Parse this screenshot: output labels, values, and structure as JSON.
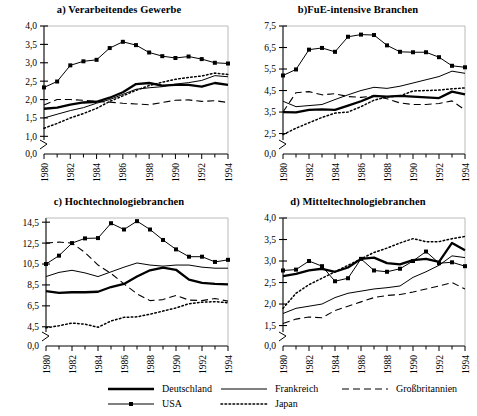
{
  "figure": {
    "width": 477,
    "height": 416,
    "background": "#ffffff",
    "line_color": "#000000",
    "axis_color": "#000000"
  },
  "legend": {
    "entries": [
      {
        "label": "Deutschland",
        "style": "thick-solid",
        "key": "deutschland"
      },
      {
        "label": "Frankreich",
        "style": "thin-solid",
        "key": "frankreich"
      },
      {
        "label": "Großbritannien",
        "style": "dashed",
        "key": "grossbritannien"
      },
      {
        "label": "USA",
        "style": "marker-line",
        "key": "usa"
      },
      {
        "label": "Japan",
        "style": "dotted",
        "key": "japan"
      }
    ]
  },
  "chart_data": [
    {
      "type": "line",
      "panel": "a",
      "title": "a) Verarbeitendes Gewerbe",
      "xlabel": "",
      "ylabel": "",
      "x": [
        1980,
        1981,
        1982,
        1983,
        1984,
        1985,
        1986,
        1987,
        1988,
        1989,
        1990,
        1991,
        1992,
        1993,
        1994
      ],
      "xtick_labels": [
        "1980",
        "1982",
        "1984",
        "1986",
        "1988",
        "1990",
        "1992",
        "1994"
      ],
      "ytick_labels": [
        "0,0",
        "1,0",
        "1,5",
        "2,0",
        "2,5",
        "3,0",
        "3,5",
        "4,0"
      ],
      "ytick_values": [
        0.0,
        1.0,
        1.5,
        2.0,
        2.5,
        3.0,
        3.5,
        4.0
      ],
      "ylim": [
        0.9,
        4.0
      ],
      "axis_break": true,
      "grid": false,
      "series": [
        {
          "name": "Deutschland",
          "style": "thick-solid",
          "values": [
            1.75,
            1.78,
            1.86,
            1.92,
            1.94,
            2.05,
            2.2,
            2.42,
            2.45,
            2.38,
            2.4,
            2.4,
            2.35,
            2.45,
            2.4
          ]
        },
        {
          "name": "USA",
          "style": "marker-line",
          "values": [
            2.33,
            2.49,
            2.93,
            3.04,
            3.08,
            3.4,
            3.57,
            3.48,
            3.28,
            3.18,
            3.13,
            3.17,
            3.1,
            3.0,
            2.98
          ]
        },
        {
          "name": "Frankreich",
          "style": "thin-solid",
          "values": [
            1.5,
            1.6,
            1.7,
            1.78,
            1.9,
            2.0,
            2.14,
            2.28,
            2.32,
            2.35,
            2.42,
            2.46,
            2.52,
            2.65,
            2.62
          ]
        },
        {
          "name": "Großbritannien",
          "style": "dashed",
          "values": [
            1.85,
            2.0,
            2.0,
            1.98,
            1.95,
            1.93,
            1.9,
            1.88,
            1.86,
            1.92,
            1.98,
            1.99,
            1.95,
            1.97,
            1.92
          ]
        },
        {
          "name": "Japan",
          "style": "dotted",
          "values": [
            1.22,
            1.35,
            1.5,
            1.62,
            1.76,
            1.95,
            2.1,
            2.25,
            2.38,
            2.47,
            2.55,
            2.6,
            2.64,
            2.72,
            2.68
          ]
        }
      ]
    },
    {
      "type": "line",
      "panel": "b",
      "title": "b)FuE-intensive Branchen",
      "xlabel": "",
      "ylabel": "",
      "x": [
        1980,
        1981,
        1982,
        1983,
        1984,
        1985,
        1986,
        1987,
        1988,
        1989,
        1990,
        1991,
        1992,
        1993,
        1994
      ],
      "xtick_labels": [
        "1980",
        "1982",
        "1984",
        "1986",
        "1988",
        "1990",
        "1992",
        "1994"
      ],
      "ytick_labels": [
        "0,0",
        "2,5",
        "3,5",
        "4,5",
        "5,5",
        "6,5",
        "7,5"
      ],
      "ytick_values": [
        0.0,
        2.5,
        3.5,
        4.5,
        5.5,
        6.5,
        7.5
      ],
      "ylim": [
        2.2,
        7.5
      ],
      "axis_break": true,
      "grid": false,
      "series": [
        {
          "name": "Deutschland",
          "style": "thick-solid",
          "values": [
            3.5,
            3.48,
            3.6,
            3.62,
            3.6,
            3.8,
            4.0,
            4.25,
            4.22,
            4.25,
            4.22,
            4.18,
            4.15,
            4.45,
            4.32
          ]
        },
        {
          "name": "USA",
          "style": "marker-line",
          "values": [
            5.2,
            5.48,
            6.4,
            6.48,
            6.3,
            7.0,
            7.1,
            7.08,
            6.6,
            6.3,
            6.28,
            6.28,
            6.05,
            5.65,
            5.58
          ]
        },
        {
          "name": "Frankreich",
          "style": "thin-solid",
          "values": [
            4.0,
            3.75,
            3.8,
            3.85,
            4.08,
            4.3,
            4.5,
            4.65,
            4.6,
            4.7,
            4.85,
            5.0,
            5.15,
            5.4,
            5.3
          ]
        },
        {
          "name": "Großbritannien",
          "style": "dashed",
          "values": [
            3.5,
            4.4,
            4.45,
            4.3,
            4.35,
            4.22,
            4.18,
            4.25,
            4.12,
            3.92,
            3.85,
            3.85,
            3.9,
            4.02,
            3.6
          ]
        },
        {
          "name": "Japan",
          "style": "dotted",
          "values": [
            2.45,
            2.75,
            3.0,
            3.25,
            3.45,
            3.5,
            3.75,
            4.05,
            4.2,
            4.25,
            4.48,
            4.5,
            4.52,
            4.58,
            4.62
          ]
        }
      ]
    },
    {
      "type": "line",
      "panel": "c",
      "title": "c) Hochtechnologiebranchen",
      "xlabel": "",
      "ylabel": "",
      "x": [
        1980,
        1981,
        1982,
        1983,
        1984,
        1985,
        1986,
        1987,
        1988,
        1989,
        1990,
        1991,
        1992,
        1993,
        1994
      ],
      "xtick_labels": [
        "1980",
        "1982",
        "1984",
        "1986",
        "1988",
        "1990",
        "1992",
        "1994"
      ],
      "ytick_labels": [
        "0,0",
        "4,5",
        "6,5",
        "8,5",
        "10,5",
        "12,5",
        "14,5"
      ],
      "ytick_values": [
        0.0,
        4.5,
        6.5,
        8.5,
        10.5,
        12.5,
        14.5
      ],
      "ylim": [
        4.0,
        14.9
      ],
      "axis_break": true,
      "grid": false,
      "series": [
        {
          "name": "Deutschland",
          "style": "thick-solid",
          "values": [
            7.9,
            7.75,
            7.8,
            7.8,
            7.85,
            8.3,
            8.6,
            9.3,
            9.9,
            10.15,
            9.95,
            9.0,
            8.7,
            8.6,
            8.55
          ]
        },
        {
          "name": "USA",
          "style": "marker-line",
          "values": [
            10.5,
            11.3,
            12.5,
            12.95,
            12.98,
            14.4,
            13.8,
            14.6,
            13.8,
            12.8,
            11.9,
            11.2,
            11.2,
            10.7,
            10.9
          ]
        },
        {
          "name": "Frankreich",
          "style": "thin-solid",
          "values": [
            9.3,
            9.7,
            9.9,
            9.65,
            9.3,
            9.75,
            10.2,
            10.6,
            10.4,
            10.3,
            10.4,
            10.4,
            10.2,
            10.1,
            10.1
          ]
        },
        {
          "name": "Großbritannien",
          "style": "dashed",
          "values": [
            12.5,
            12.6,
            12.5,
            11.6,
            10.4,
            9.6,
            8.6,
            7.65,
            7.0,
            7.1,
            7.5,
            7.05,
            7.0,
            7.2,
            6.95
          ]
        },
        {
          "name": "Japan",
          "style": "dotted",
          "values": [
            4.4,
            4.6,
            4.85,
            4.75,
            4.45,
            5.05,
            5.4,
            5.45,
            5.7,
            6.0,
            6.3,
            6.7,
            6.85,
            6.9,
            6.8
          ]
        }
      ]
    },
    {
      "type": "line",
      "panel": "d",
      "title": "d) Mitteltechnologiebranchen",
      "xlabel": "",
      "ylabel": "",
      "x": [
        1980,
        1981,
        1982,
        1983,
        1984,
        1985,
        1986,
        1987,
        1988,
        1989,
        1990,
        1991,
        1992,
        1993,
        1994
      ],
      "xtick_labels": [
        "1980",
        "1982",
        "1984",
        "1986",
        "1988",
        "1990",
        "1992",
        "1994"
      ],
      "ytick_labels": [
        "0,0",
        "1,5",
        "2,0",
        "2,5",
        "3,0",
        "3,5",
        "4,0"
      ],
      "ytick_values": [
        0.0,
        1.5,
        2.0,
        2.5,
        3.0,
        3.5,
        4.0
      ],
      "ylim": [
        1.35,
        4.0
      ],
      "axis_break": true,
      "grid": false,
      "series": [
        {
          "name": "Deutschland",
          "style": "thick-solid",
          "values": [
            2.65,
            2.7,
            2.78,
            2.82,
            2.75,
            2.85,
            3.05,
            3.08,
            2.95,
            2.92,
            3.02,
            3.05,
            2.98,
            3.42,
            3.25
          ]
        },
        {
          "name": "USA",
          "style": "marker-line",
          "values": [
            2.78,
            2.8,
            3.0,
            2.88,
            2.53,
            2.6,
            3.05,
            2.78,
            2.75,
            2.82,
            3.0,
            3.22,
            2.95,
            2.97,
            2.88
          ]
        },
        {
          "name": "Frankreich",
          "style": "thin-solid",
          "values": [
            1.78,
            1.9,
            1.95,
            2.0,
            2.15,
            2.25,
            2.3,
            2.35,
            2.38,
            2.42,
            2.62,
            2.75,
            2.9,
            3.12,
            3.08
          ]
        },
        {
          "name": "Großbritannien",
          "style": "dashed",
          "values": [
            1.55,
            1.65,
            1.7,
            1.68,
            1.85,
            1.95,
            2.05,
            2.15,
            2.2,
            2.22,
            2.28,
            2.35,
            2.42,
            2.5,
            2.35
          ]
        },
        {
          "name": "Japan",
          "style": "dotted",
          "values": [
            1.9,
            2.25,
            2.45,
            2.6,
            2.75,
            2.9,
            3.05,
            3.2,
            3.3,
            3.42,
            3.52,
            3.45,
            3.45,
            3.52,
            3.57
          ]
        }
      ]
    }
  ]
}
